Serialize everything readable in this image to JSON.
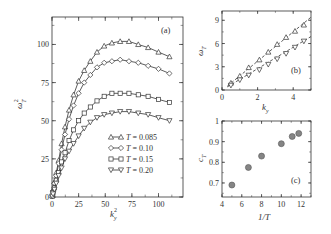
{
  "chart_data": [
    {
      "panel": "(a)",
      "type": "line",
      "xlabel": "k_y^2",
      "ylabel": "ω_T^2",
      "xlim": [
        0,
        123
      ],
      "ylim": [
        0,
        118
      ],
      "xticks": [
        0,
        25,
        50,
        75,
        100
      ],
      "yticks": [
        0,
        25,
        50,
        75,
        100
      ],
      "grid": false,
      "legend_position": "lower right",
      "series": [
        {
          "name": "T = 0.085",
          "marker": "triangle-up",
          "x": [
            0.25,
            1,
            2.25,
            4,
            6.25,
            9,
            12.25,
            16,
            20.25,
            25,
            30.25,
            36,
            42.25,
            49,
            56.25,
            64,
            72.25,
            81,
            90.25,
            100,
            110.25
          ],
          "y": [
            1,
            5,
            10,
            16,
            24,
            35,
            46,
            57,
            67,
            76,
            83,
            89,
            95,
            99,
            101,
            102,
            102,
            100,
            98,
            95,
            92
          ]
        },
        {
          "name": "T = 0.10",
          "marker": "diamond",
          "x": [
            0.25,
            1,
            2.25,
            4,
            6.25,
            9,
            12.25,
            16,
            20.25,
            25,
            30.25,
            36,
            42.25,
            49,
            56.25,
            64,
            72.25,
            81,
            90.25,
            100,
            110.25
          ],
          "y": [
            1,
            4,
            9,
            14,
            22,
            31,
            41,
            51,
            60,
            68,
            75,
            80,
            85,
            88,
            89,
            90,
            89,
            88,
            86,
            84,
            81
          ]
        },
        {
          "name": "T = 0.15",
          "marker": "square",
          "x": [
            0.25,
            1,
            2.25,
            4,
            6.25,
            9,
            12.25,
            16,
            20.25,
            25,
            30.25,
            36,
            42.25,
            49,
            56.25,
            64,
            72.25,
            81,
            90.25,
            100,
            110.25
          ],
          "y": [
            0.5,
            3,
            6,
            11,
            16,
            23,
            29,
            37,
            44,
            50,
            55,
            59,
            63,
            66,
            68,
            68,
            68,
            67,
            66,
            64,
            62
          ]
        },
        {
          "name": "T = 0.20",
          "marker": "triangle-down",
          "x": [
            0.25,
            1,
            2.25,
            4,
            6.25,
            9,
            12.25,
            16,
            20.25,
            25,
            30.25,
            36,
            42.25,
            49,
            56.25,
            64,
            72.25,
            81,
            90.25,
            100,
            110.25
          ],
          "y": [
            0.5,
            2,
            5,
            9,
            14,
            19,
            25,
            30,
            35,
            40,
            45,
            49,
            52,
            54,
            55,
            56,
            56,
            55,
            54,
            52,
            50
          ]
        }
      ]
    },
    {
      "panel": "(b)",
      "type": "scatter",
      "xlabel": "k_y",
      "ylabel": "ω_T",
      "xlim": [
        0,
        5
      ],
      "ylim": [
        0,
        10.2
      ],
      "xticks": [
        0,
        2,
        4
      ],
      "yticks": [
        0,
        3,
        6,
        9
      ],
      "grid": false,
      "series": [
        {
          "name": "T = 0.085",
          "marker": "triangle-up",
          "fit_line": "dashed",
          "x": [
            0.5,
            1.0,
            1.5,
            2.1,
            2.6,
            3.1,
            3.6,
            4.1,
            4.6
          ],
          "y": [
            0.9,
            1.8,
            2.9,
            3.9,
            4.9,
            5.9,
            6.8,
            7.6,
            8.4
          ]
        },
        {
          "name": "T = 0.20",
          "marker": "triangle-down",
          "fit_line": "dashed",
          "x": [
            0.5,
            1.0,
            1.5,
            2.1,
            2.6,
            3.1,
            3.6,
            4.1,
            4.6
          ],
          "y": [
            0.6,
            1.3,
            1.9,
            2.6,
            3.3,
            4.0,
            4.7,
            5.5,
            6.3
          ]
        }
      ],
      "fit_lines": [
        {
          "name": "fit T = 0.085",
          "x": [
            0.3,
            5.0
          ],
          "y": [
            0.5,
            9.4
          ]
        },
        {
          "name": "fit T = 0.20",
          "x": [
            0.3,
            5.0
          ],
          "y": [
            0.4,
            6.9
          ]
        }
      ]
    },
    {
      "panel": "(c)",
      "type": "scatter",
      "xlabel": "1/T",
      "ylabel": "c_T",
      "xlim": [
        4,
        13
      ],
      "ylim": [
        0.632,
        1.0
      ],
      "xticks": [
        4,
        6,
        8,
        10,
        12
      ],
      "yticks": [
        0.7,
        0.8,
        0.9,
        1
      ],
      "ytick_labels": [
        "0.7",
        "0.8",
        "0.9",
        "1"
      ],
      "grid": false,
      "marker_color": "#858585",
      "x": [
        5.0,
        6.67,
        8.0,
        10.0,
        11.1,
        11.76
      ],
      "y": [
        0.69,
        0.775,
        0.83,
        0.89,
        0.925,
        0.94
      ]
    }
  ],
  "labels": {
    "a_tag": "(a)",
    "b_tag": "(b)",
    "c_tag": "(c)",
    "a_xlabel_base": "k",
    "a_xlabel_sub": "y",
    "a_xlabel_sup": "2",
    "a_ylabel_base": "ω",
    "a_ylabel_sub": "T",
    "a_ylabel_sup": "2",
    "b_xlabel_base": "k",
    "b_xlabel_sub": "y",
    "b_ylabel_base": "ω",
    "b_ylabel_sub": "T",
    "c_xlabel": "1/T",
    "c_ylabel_base": "c",
    "c_ylabel_sub": "T",
    "legend": [
      {
        "T_sym": "T",
        "value": " = 0.085"
      },
      {
        "T_sym": "T",
        "value": " = 0.10"
      },
      {
        "T_sym": "T",
        "value": " = 0.15"
      },
      {
        "T_sym": "T",
        "value": " = 0.20"
      }
    ]
  },
  "colors": {
    "axis": "#333333",
    "marker_stroke": "#333333",
    "dot_fill": "#858585",
    "dot_stroke": "#555555"
  }
}
